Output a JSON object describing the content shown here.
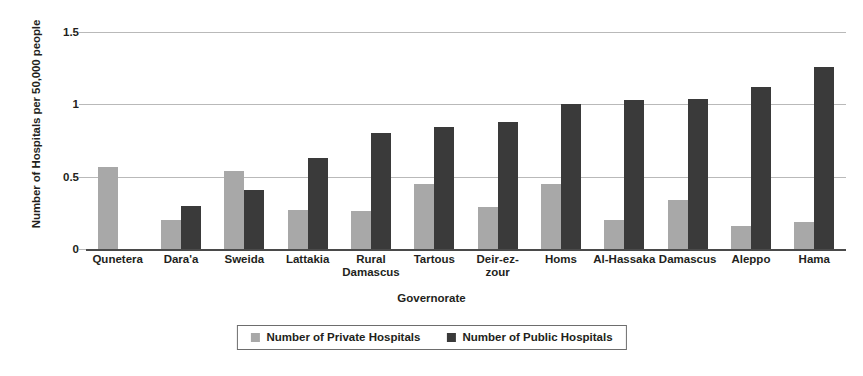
{
  "chart_data": {
    "type": "bar",
    "title": "",
    "xlabel": "Governorate",
    "ylabel": "Number of Hospitals per 50,000 people",
    "ylim": [
      0,
      1.5
    ],
    "yticks": [
      "0",
      "0.5",
      "1",
      "1.5"
    ],
    "ytick_values": [
      0,
      0.5,
      1,
      1.5
    ],
    "grid": "horizontal",
    "legend_position": "bottom-center",
    "categories": [
      "Qunetera",
      "Dara'a",
      "Sweida",
      "Lattakia",
      "Rural Damascus",
      "Tartous",
      "Deir-ez-zour",
      "Homs",
      "Al-Hassaka",
      "Damascus",
      "Aleppo",
      "Hama"
    ],
    "category_lines": [
      [
        "Qunetera"
      ],
      [
        "Dara'a"
      ],
      [
        "Sweida"
      ],
      [
        "Lattakia"
      ],
      [
        "Rural",
        "Damascus"
      ],
      [
        "Tartous"
      ],
      [
        "Deir-ez-zour"
      ],
      [
        "Homs"
      ],
      [
        "Al-Hassaka"
      ],
      [
        "Damascus"
      ],
      [
        "Aleppo"
      ],
      [
        "Hama"
      ]
    ],
    "series": [
      {
        "name": "Number of Private Hospitals",
        "color": "#a8a8a8",
        "values": [
          0.57,
          0.2,
          0.54,
          0.27,
          0.26,
          0.45,
          0.29,
          0.45,
          0.2,
          0.34,
          0.16,
          0.19
        ]
      },
      {
        "name": "Number of Public Hospitals",
        "color": "#3a3a3a",
        "values": [
          0,
          0.3,
          0.41,
          0.63,
          0.8,
          0.84,
          0.88,
          1.0,
          1.03,
          1.04,
          1.12,
          1.26
        ]
      }
    ]
  },
  "legend": {
    "items": [
      {
        "label": "Number of Private Hospitals",
        "color": "#a8a8a8"
      },
      {
        "label": "Number of Public Hospitals",
        "color": "#3a3a3a"
      }
    ]
  },
  "axes": {
    "y_title": "Number of Hospitals per 50,000 people",
    "x_title": "Governorate"
  },
  "colors": {
    "private": "#a8a8a8",
    "public": "#3a3a3a",
    "gridline": "#b9b9b9",
    "axis": "#4a4a4a",
    "text": "#231f20",
    "background": "#ffffff"
  }
}
